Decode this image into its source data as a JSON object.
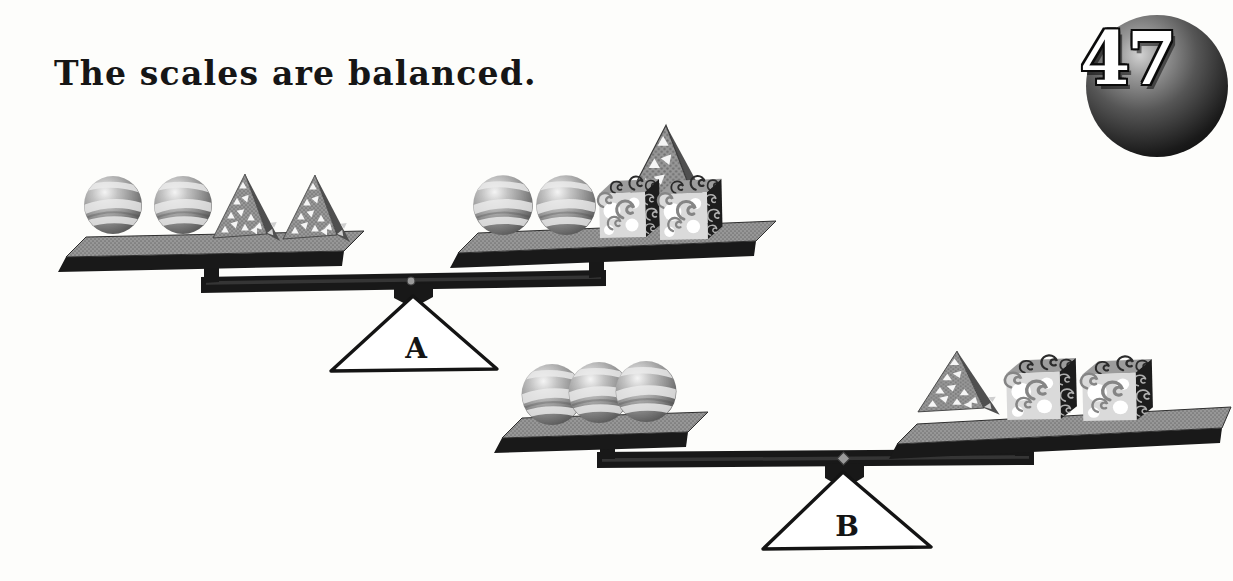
{
  "title": {
    "text": "The scales are balanced."
  },
  "badge": {
    "number": "47"
  },
  "scales": [
    {
      "label": "A",
      "left_pan_objects": [
        "sphere",
        "sphere",
        "pyramid",
        "pyramid"
      ],
      "right_pan_objects": [
        "sphere",
        "sphere",
        "pyramid",
        "cube",
        "cube"
      ]
    },
    {
      "label": "B",
      "left_pan_objects": [
        "sphere",
        "sphere",
        "sphere"
      ],
      "right_pan_objects": [
        "pyramid",
        "cube",
        "cube"
      ]
    }
  ],
  "colors": {
    "ink": "#181818",
    "pan_gray": "#969696",
    "paper": "#fdfdfb",
    "fulcrum_fill": "#ffffff"
  }
}
